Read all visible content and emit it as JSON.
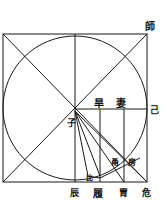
{
  "diagram": {
    "stroke_color": "#1a1a1a",
    "background": "#ffffff",
    "labels": {
      "top_right": "師",
      "right_mid": "己",
      "upper_a": "旱",
      "upper_b": "妻",
      "center": "子",
      "inner_a": "甬",
      "inner_b": "房",
      "inner_c": "比",
      "bottom_1": "辰",
      "bottom_2": "履",
      "bottom_3": "胃",
      "bottom_4": "危"
    }
  }
}
